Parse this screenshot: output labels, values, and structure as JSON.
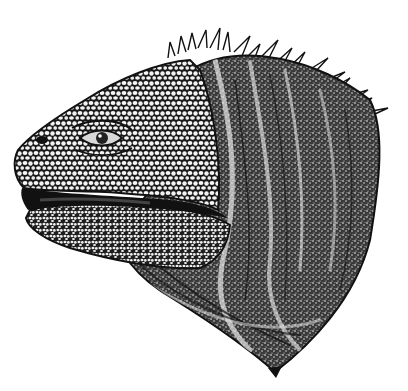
{
  "image": {
    "subject": "Pen-and-ink stipple illustration of a marine iguana head in profile facing left, mouth slightly open, with a crest of spines along the back of the head",
    "alt": "Iguana head illustration",
    "colors": {
      "background": "#ffffff",
      "ink": "#111111",
      "scale_fill": "#f4f4f4",
      "mid_gray": "#4a4a4a"
    }
  }
}
